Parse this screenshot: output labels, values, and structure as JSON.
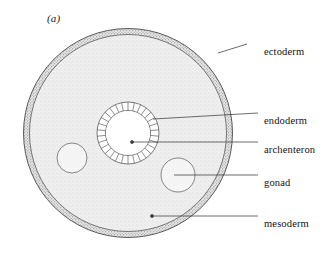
{
  "figure": {
    "panel_label": "(a)",
    "colors": {
      "ectoderm_fill": "#d9d9d9",
      "mesoderm_fill": "#ececec",
      "archenteron_fill": "#ffffff",
      "gonad_fill": "#f2f2f2",
      "endoderm_cell_fill": "#ffffff",
      "outline": "#4a4a4a",
      "leader_line": "#3c3c3c",
      "text": "#15120f"
    },
    "geometry": {
      "center_x": 128,
      "center_y": 133,
      "outer_radius": 105,
      "ectoderm_thickness": 6,
      "archenteron_radius": 22,
      "endoderm_outer_radius": 31,
      "endoderm_cell_count": 30,
      "gonad_left": {
        "cx": 72,
        "cy": 158,
        "r": 15
      },
      "gonad_right": {
        "cx": 178,
        "cy": 175,
        "r": 17
      }
    }
  },
  "labels": [
    {
      "id": "ectoderm",
      "text": "ectoderm",
      "text_x": 264,
      "text_y": 47,
      "leader": {
        "x1": 247,
        "y1": 44,
        "x2": 218,
        "y2": 53
      },
      "marker": "none"
    },
    {
      "id": "endoderm",
      "text": "endoderm",
      "text_x": 264,
      "text_y": 116,
      "leader": {
        "x1": 258,
        "y1": 113,
        "x2": 153,
        "y2": 119
      },
      "marker": "none"
    },
    {
      "id": "archenteron",
      "text": "archenteron",
      "text_x": 264,
      "text_y": 145,
      "leader": {
        "x1": 258,
        "y1": 142,
        "x2": 132,
        "y2": 142
      },
      "marker": "dot"
    },
    {
      "id": "gonad",
      "text": "gonad",
      "text_x": 264,
      "text_y": 178,
      "leader": {
        "x1": 258,
        "y1": 175,
        "x2": 174,
        "y2": 175
      },
      "marker": "none"
    },
    {
      "id": "mesoderm",
      "text": "mesoderm",
      "text_x": 264,
      "text_y": 219,
      "leader": {
        "x1": 258,
        "y1": 216,
        "x2": 152,
        "y2": 216
      },
      "marker": "dot"
    }
  ]
}
